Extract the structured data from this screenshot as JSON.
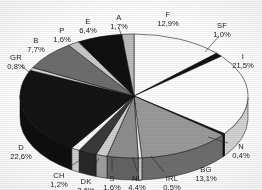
{
  "chart_data": {
    "type": "pie",
    "title": "",
    "subtitle": "",
    "xlabel": "",
    "ylabel": "",
    "legend_position": "none",
    "grid": false,
    "value_suffix": "%",
    "decimal_separator": ",",
    "style": "3d-exploded-grayscale",
    "center": {
      "x": 134,
      "y": 96
    },
    "radius_x": 114,
    "radius_y": 62,
    "depth": 22,
    "start_angle_deg": -90,
    "direction": "clockwise",
    "categories": [
      "F",
      "SF",
      "I",
      "N",
      "BG",
      "IRL",
      "NL",
      "S",
      "DK",
      "CH",
      "D",
      "GR",
      "B",
      "P",
      "E",
      "A"
    ],
    "values": [
      12.9,
      1.0,
      21.5,
      0.4,
      13.1,
      0.5,
      4.4,
      1.6,
      2.6,
      1.2,
      22.6,
      0.8,
      7.7,
      1.6,
      6.4,
      1.7
    ],
    "labels": [
      "12,9%",
      "1,0%",
      "21,5%",
      "0,4%",
      "13,1%",
      "0,5%",
      "4,4%",
      "1,6%",
      "2,6%",
      "1,2%",
      "22,6%",
      "0,8%",
      "7,7%",
      "1,6%",
      "6,4%",
      "1,7%"
    ],
    "colors": [
      "#fbfbfb",
      "#121212",
      "#fdfdfd",
      "#161616",
      "#9a9a9a",
      "#f4f4f4",
      "#8e8e8e",
      "#cfcfcf",
      "#3a3a3a",
      "#fafafa",
      "#141414",
      "#d6d6d6",
      "#6e6e6e",
      "#cacaca",
      "#101010",
      "#bdbdbd"
    ],
    "side_colors": [
      "#cfcfcf",
      "#0d0d0d",
      "#d2d2d2",
      "#101010",
      "#6e6e6e",
      "#c6c6c6",
      "#646464",
      "#9e9e9e",
      "#282828",
      "#cdcdcd",
      "#0e0e0e",
      "#a6a6a6",
      "#4e4e4e",
      "#9a9a9a",
      "#0b0b0b",
      "#909090"
    ],
    "slices": [
      {
        "code": "F",
        "value": 12.9,
        "label": "12,9%",
        "label_x": 168,
        "label_y": 15,
        "leader": false
      },
      {
        "code": "SF",
        "value": 1.0,
        "label": "1,0%",
        "label_x": 222,
        "label_y": 26,
        "leader": true,
        "lx1": 219,
        "ly1": 36,
        "lx2": 205,
        "ly2": 52
      },
      {
        "code": "I",
        "value": 21.5,
        "label": "21,5%",
        "label_x": 243,
        "label_y": 57,
        "leader": false
      },
      {
        "code": "N",
        "value": 0.4,
        "label": "0,4%",
        "label_x": 241,
        "label_y": 147,
        "leader": true,
        "lx1": 228,
        "ly1": 143,
        "lx2": 208,
        "ly2": 137
      },
      {
        "code": "BG",
        "value": 13.1,
        "label": "13,1%",
        "label_x": 206,
        "label_y": 170,
        "leader": false
      },
      {
        "code": "IRL",
        "value": 0.5,
        "label": "0,5%",
        "label_x": 172,
        "label_y": 179,
        "leader": true,
        "lx1": 164,
        "ly1": 172,
        "lx2": 151,
        "ly2": 156
      },
      {
        "code": "NL",
        "value": 4.4,
        "label": "4,4%",
        "label_x": 137,
        "label_y": 179,
        "leader": true,
        "lx1": 137,
        "ly1": 171,
        "lx2": 133,
        "ly2": 158
      },
      {
        "code": "S",
        "value": 1.6,
        "label": "1,6%",
        "label_x": 112,
        "label_y": 179,
        "leader": true,
        "lx1": 112,
        "ly1": 171,
        "lx2": 112,
        "ly2": 158
      },
      {
        "code": "DK",
        "value": 2.6,
        "label": "2,6%",
        "label_x": 86,
        "label_y": 182,
        "leader": true,
        "lx1": 90,
        "ly1": 173,
        "lx2": 99,
        "ly2": 158
      },
      {
        "code": "CH",
        "value": 1.2,
        "label": "1,2%",
        "label_x": 59,
        "label_y": 176,
        "leader": true,
        "lx1": 68,
        "ly1": 168,
        "lx2": 86,
        "ly2": 156
      },
      {
        "code": "D",
        "value": 22.6,
        "label": "22,6%",
        "label_x": 21,
        "label_y": 148,
        "leader": false
      },
      {
        "code": "GR",
        "value": 0.8,
        "label": "0,8%",
        "label_x": 16,
        "label_y": 58,
        "leader": true,
        "lx1": 21,
        "ly1": 66,
        "lx2": 32,
        "ly2": 74
      },
      {
        "code": "B",
        "value": 7.7,
        "label": "7,7%",
        "label_x": 36,
        "label_y": 41,
        "leader": false
      },
      {
        "code": "P",
        "value": 1.6,
        "label": "1,6%",
        "label_x": 62,
        "label_y": 31,
        "leader": false
      },
      {
        "code": "E",
        "value": 6.4,
        "label": "6,4%",
        "label_x": 88,
        "label_y": 22,
        "leader": false
      },
      {
        "code": "A",
        "value": 1.7,
        "label": "1,7%",
        "label_x": 119,
        "label_y": 18,
        "leader": true,
        "lx1": 119,
        "ly1": 28,
        "lx2": 124,
        "ly2": 44
      }
    ]
  },
  "accessibility": {
    "chart_description": "Three-dimensional pie chart of percentage shares by country code"
  }
}
